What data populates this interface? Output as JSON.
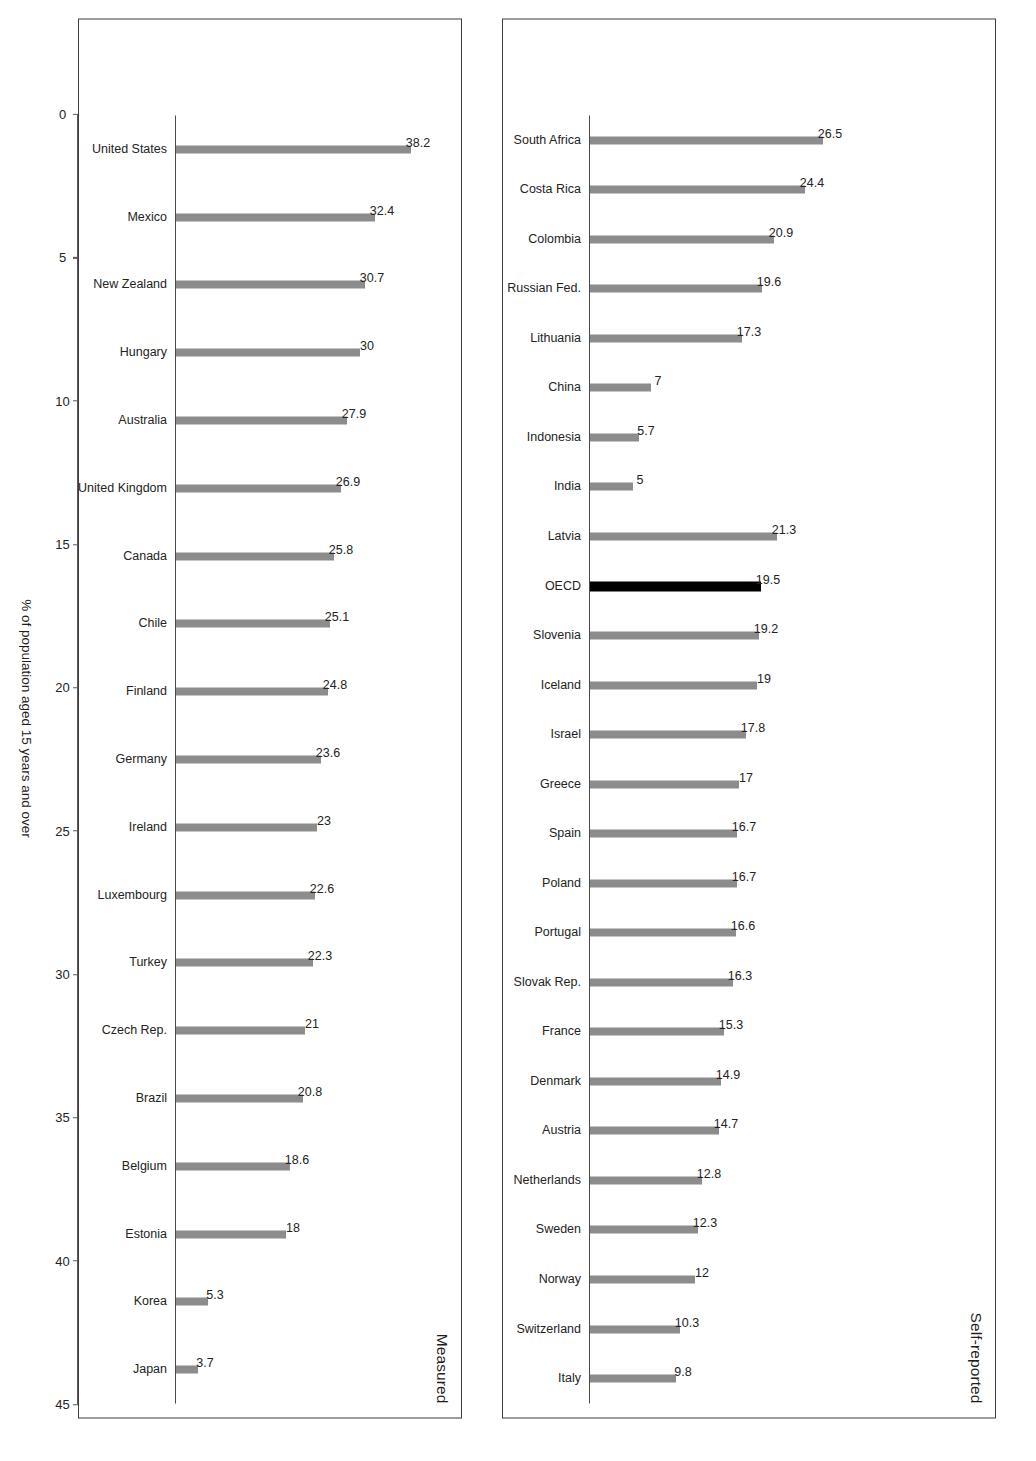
{
  "chart_data": {
    "type": "bar",
    "title": "",
    "xlabel": "",
    "ylabel": "% of population aged 15 years and over",
    "ylim": [
      0,
      45
    ],
    "axis_ticks": [
      "0",
      "5",
      "10",
      "15",
      "20",
      "25",
      "30",
      "35",
      "40",
      "45"
    ],
    "grid": false,
    "legend": "none",
    "orientation": "vertical-bars-rotated-page",
    "colors": {
      "bar": "#8c8c8c",
      "highlight_bar": "#000000",
      "text": "#232323",
      "axis": "#5a5a5a",
      "panel_border": "#3d3d3d"
    },
    "panels": [
      {
        "title": "Self-reported",
        "categories": [
          "South Africa",
          "Costa Rica",
          "Colombia",
          "Russian Fed.",
          "Lithuania",
          "China",
          "Indonesia",
          "India",
          "Latvia",
          "OECD",
          "Slovenia",
          "Iceland",
          "Israel",
          "Greece",
          "Spain",
          "Poland",
          "Portugal",
          "Slovak Rep.",
          "France",
          "Denmark",
          "Austria",
          "Netherlands",
          "Sweden",
          "Norway",
          "Switzerland",
          "Italy"
        ],
        "values": [
          26.5,
          24.4,
          20.9,
          19.6,
          17.3,
          7,
          5.7,
          5,
          21.3,
          19.5,
          19.2,
          19,
          17.8,
          17,
          16.7,
          16.7,
          16.6,
          16.3,
          15.3,
          14.9,
          14.7,
          12.8,
          12.3,
          12,
          10.3,
          9.8
        ],
        "value_labels": [
          "26.5",
          "24.4",
          "20.9",
          "19.6",
          "17.3",
          "7",
          "5.7",
          "5",
          "21.3",
          "19.5",
          "19.2",
          "19",
          "17.8",
          "17",
          "16.7",
          "16.7",
          "16.6",
          "16.3",
          "15.3",
          "14.9",
          "14.7",
          "12.8",
          "12.3",
          "12",
          "10.3",
          "9.8"
        ],
        "highlight_index": 9
      },
      {
        "title": "Measured",
        "categories": [
          "United States",
          "Mexico",
          "New Zealand",
          "Hungary",
          "Australia",
          "United Kingdom",
          "Canada",
          "Chile",
          "Finland",
          "Germany",
          "Ireland",
          "Luxembourg",
          "Turkey",
          "Czech Rep.",
          "Brazil",
          "Belgium",
          "Estonia",
          "Korea",
          "Japan"
        ],
        "values": [
          38.2,
          32.4,
          30.7,
          30,
          27.9,
          26.9,
          25.8,
          25.1,
          24.8,
          23.6,
          23,
          22.6,
          22.3,
          21,
          20.8,
          18.6,
          18,
          5.3,
          3.7
        ],
        "value_labels": [
          "38.2",
          "32.4",
          "30.7",
          "30",
          "27.9",
          "26.9",
          "25.8",
          "25.1",
          "24.8",
          "23.6",
          "23",
          "22.6",
          "22.3",
          "21",
          "20.8",
          "18.6",
          "18",
          "5.3",
          "3.7"
        ],
        "highlight_index": -1
      }
    ]
  }
}
